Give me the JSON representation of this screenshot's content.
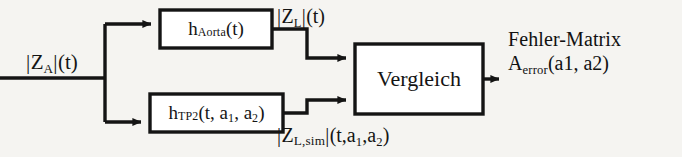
{
  "diagram": {
    "background_color": "#f5f4f1",
    "line_color": "#141414",
    "box_fill": "#ffffff",
    "blocks": [
      {
        "id": "h-aorta",
        "label": "h_Aorta(t)",
        "label_parts": {
          "base": "h",
          "subscript": "Aorta",
          "args": "(t)"
        }
      },
      {
        "id": "h-tp2",
        "label": "h_TP2(t, a1, a2)",
        "label_parts": {
          "base": "h",
          "subscript": "TP2",
          "args": "(t, a1, a2)"
        }
      },
      {
        "id": "vergleich",
        "label": "Vergleich"
      }
    ],
    "signals": {
      "input": {
        "id": "input-za",
        "label": "|Z_A|(t)",
        "label_parts": {
          "magnitude": "Z",
          "subscript": "A",
          "args": "(t)"
        }
      },
      "aorta_output": {
        "id": "zl",
        "label": "|Z_L|(t)",
        "label_parts": {
          "magnitude": "Z",
          "subscript": "L",
          "args": "(t)"
        }
      },
      "tp2_output": {
        "id": "zl-sim",
        "label": "|Z_L,sim|(t,a1,a2)",
        "label_parts": {
          "magnitude": "Z",
          "subscript": "L,sim",
          "args": "(t,a1,a2)"
        }
      },
      "output": {
        "id": "fehler-matrix",
        "line1": "Fehler-Matrix",
        "line2": "A_error(a1, a2)",
        "line2_parts": {
          "base": "A",
          "subscript": "error",
          "args": "(a1, a2)"
        }
      }
    }
  }
}
